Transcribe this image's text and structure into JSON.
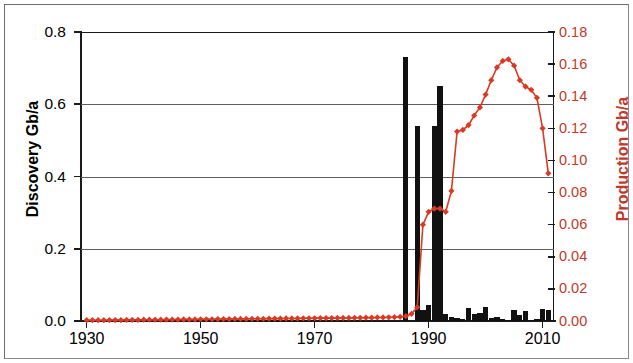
{
  "figure": {
    "width": 633,
    "height": 363,
    "background": "#ffffff",
    "border_color": "#8a8a8a"
  },
  "axes": {
    "left": {
      "title": "Discovery Gb/a",
      "color": "#000000",
      "ticks": [
        "0.0",
        "0.2",
        "0.4",
        "0.6",
        "0.8"
      ],
      "tick_values": [
        0.0,
        0.2,
        0.4,
        0.6,
        0.8
      ],
      "min": 0.0,
      "max": 0.8
    },
    "right": {
      "title": "Production Gb/a",
      "color": "#c0392b",
      "ticks": [
        "0.00",
        "0.02",
        "0.04",
        "0.06",
        "0.08",
        "0.10",
        "0.12",
        "0.14",
        "0.16",
        "0.18"
      ],
      "tick_values": [
        0.0,
        0.02,
        0.04,
        0.06,
        0.08,
        0.1,
        0.12,
        0.14,
        0.16,
        0.18
      ],
      "min": 0.0,
      "max": 0.18
    },
    "bottom": {
      "ticks": [
        "1930",
        "1950",
        "1970",
        "1990",
        "2010"
      ],
      "tick_values": [
        1930,
        1950,
        1970,
        1990,
        2010
      ],
      "min": 1929,
      "max": 2012
    }
  },
  "chart_data": {
    "type": "bar",
    "title": "",
    "xlabel": "",
    "ylabel": "Discovery Gb/a",
    "y2label": "Production Gb/a",
    "xlim": [
      1929,
      2012
    ],
    "ylim": [
      0,
      0.8
    ],
    "y2lim": [
      0,
      0.18
    ],
    "grid": true,
    "legend": "none",
    "x": [
      1930,
      1931,
      1932,
      1933,
      1934,
      1935,
      1936,
      1937,
      1938,
      1939,
      1940,
      1941,
      1942,
      1943,
      1944,
      1945,
      1946,
      1947,
      1948,
      1949,
      1950,
      1951,
      1952,
      1953,
      1954,
      1955,
      1956,
      1957,
      1958,
      1959,
      1960,
      1961,
      1962,
      1963,
      1964,
      1965,
      1966,
      1967,
      1968,
      1969,
      1970,
      1971,
      1972,
      1973,
      1974,
      1975,
      1976,
      1977,
      1978,
      1979,
      1980,
      1981,
      1982,
      1983,
      1984,
      1985,
      1986,
      1987,
      1988,
      1989,
      1990,
      1991,
      1992,
      1993,
      1994,
      1995,
      1996,
      1997,
      1998,
      1999,
      2000,
      2001,
      2002,
      2003,
      2004,
      2005,
      2006,
      2007,
      2008,
      2009,
      2010,
      2011
    ],
    "series": [
      {
        "name": "Discovery Gb/a",
        "axis": "left",
        "type": "bar",
        "color": "#111111",
        "values": [
          0,
          0,
          0,
          0,
          0,
          0,
          0,
          0,
          0,
          0,
          0,
          0,
          0,
          0,
          0,
          0,
          0,
          0,
          0,
          0,
          0,
          0,
          0,
          0,
          0,
          0,
          0,
          0,
          0,
          0,
          0,
          0,
          0,
          0,
          0,
          0,
          0,
          0,
          0,
          0,
          0,
          0,
          0,
          0,
          0,
          0,
          0,
          0,
          0,
          0,
          0,
          0,
          0,
          0,
          0,
          0,
          0.73,
          0,
          0.54,
          0.03,
          0.045,
          0.54,
          0.65,
          0.02,
          0.012,
          0.008,
          0.005,
          0.035,
          0.02,
          0.022,
          0.038,
          0.008,
          0.012,
          0.005,
          0.004,
          0.03,
          0.018,
          0.028,
          0.004,
          0.005,
          0.032,
          0.03
        ]
      },
      {
        "name": "Production Gb/a",
        "axis": "right",
        "type": "line",
        "color": "#d93a23",
        "marker": "diamond",
        "values": [
          0.0005,
          0.0005,
          0.0005,
          0.0005,
          0.0006,
          0.0006,
          0.0006,
          0.0007,
          0.0007,
          0.0007,
          0.0008,
          0.0008,
          0.0008,
          0.0008,
          0.0009,
          0.0009,
          0.0009,
          0.001,
          0.001,
          0.001,
          0.0011,
          0.0011,
          0.0011,
          0.0012,
          0.0012,
          0.0012,
          0.0013,
          0.0013,
          0.0013,
          0.0014,
          0.0014,
          0.0014,
          0.0015,
          0.0015,
          0.0015,
          0.0016,
          0.0016,
          0.0016,
          0.0017,
          0.0017,
          0.0017,
          0.0018,
          0.0018,
          0.0018,
          0.0019,
          0.0019,
          0.0019,
          0.002,
          0.002,
          0.0021,
          0.0021,
          0.0022,
          0.0022,
          0.0023,
          0.0024,
          0.0026,
          0.003,
          0.0045,
          0.0085,
          0.06,
          0.068,
          0.07,
          0.07,
          0.068,
          0.081,
          0.118,
          0.119,
          0.122,
          0.128,
          0.133,
          0.141,
          0.15,
          0.158,
          0.162,
          0.163,
          0.159,
          0.15,
          0.146,
          0.144,
          0.139,
          0.12,
          0.092
        ]
      }
    ]
  }
}
